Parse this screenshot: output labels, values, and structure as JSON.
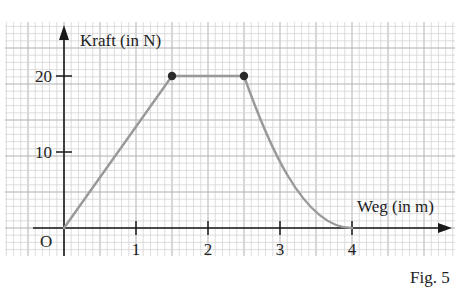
{
  "chart_data": {
    "type": "line",
    "title": "",
    "xlabel": "Weg (in m)",
    "ylabel": "Kraft (in N)",
    "origin_label": "O",
    "x_ticks": [
      1,
      2,
      3,
      4
    ],
    "y_ticks": [
      10,
      20
    ],
    "xlim": [
      -0.8,
      5.4
    ],
    "ylim": [
      -3.7,
      27.1
    ],
    "grid": true,
    "series": [
      {
        "name": "Kraft-Weg-Kurve",
        "segments": [
          {
            "kind": "linear",
            "points": [
              [
                0,
                0
              ],
              [
                1.5,
                20
              ]
            ]
          },
          {
            "kind": "linear",
            "points": [
              [
                1.5,
                20
              ],
              [
                2.5,
                20
              ]
            ]
          },
          {
            "kind": "curve",
            "points": [
              [
                2.5,
                20
              ],
              [
                3.0,
                10
              ],
              [
                3.5,
                3
              ],
              [
                3.9,
                0.2
              ],
              [
                4.0,
                0
              ]
            ]
          }
        ],
        "marked_points": [
          [
            1.5,
            20
          ],
          [
            2.5,
            20
          ]
        ]
      }
    ],
    "caption": "Fig. 5"
  },
  "colors": {
    "curve": "#999999",
    "axis": "#1a1a1a",
    "grid_minor": "#d4d4d4",
    "grid_major": "#b0b0b0",
    "point": "#2a2a2a"
  }
}
